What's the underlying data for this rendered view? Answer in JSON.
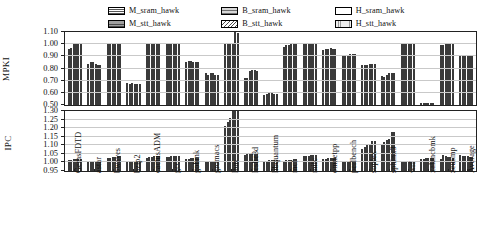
{
  "legend": {
    "position": "top-center",
    "entries": [
      {
        "label": "M_sram_hawk",
        "pattern": "p-m-sram"
      },
      {
        "label": "B_sram_hawk",
        "pattern": "p-b-sram"
      },
      {
        "label": "H_sram_hawk",
        "pattern": "p-h-sram"
      },
      {
        "label": "M_stt_hawk",
        "pattern": "p-m-stt"
      },
      {
        "label": "B_stt_hawk",
        "pattern": "p-b-stt"
      },
      {
        "label": "H_stt_hawk",
        "pattern": "p-h-stt"
      }
    ]
  },
  "chart_data": [
    {
      "type": "bar",
      "title": "",
      "ylabel": "MPKI",
      "xlabel": "",
      "ylim": [
        0.5,
        1.1
      ],
      "yticks": [
        "1.10",
        "1.00",
        "0.90",
        "0.80",
        "0.70",
        "0.60",
        "0.50"
      ],
      "ytick_values": [
        1.1,
        1.0,
        0.9,
        0.8,
        0.7,
        0.6,
        0.5
      ],
      "grid": true,
      "categories": [
        "GemsFDTD",
        "astar",
        "bwaves",
        "bzip2",
        "cactusADM",
        "gcc",
        "gobmk",
        "gromacs",
        "lbm",
        "leslie3d",
        "libquantum",
        "mcf",
        "milc",
        "omnetpp",
        "perlbench",
        "soplex",
        "sphinx3",
        "wrf",
        "xalancbmk",
        "zeusmp",
        "Average"
      ],
      "series": [
        {
          "name": "M_sram_hawk",
          "values": [
            0.96,
            0.84,
            1.0,
            0.68,
            1.0,
            1.0,
            0.85,
            0.76,
            1.0,
            0.72,
            0.58,
            0.98,
            1.0,
            0.95,
            0.9,
            0.83,
            0.74,
            1.0,
            0.52,
            0.99,
            0.9
          ]
        },
        {
          "name": "M_stt_hawk",
          "values": [
            0.97,
            0.85,
            1.0,
            0.67,
            1.0,
            1.0,
            0.86,
            0.75,
            1.0,
            0.72,
            0.59,
            0.99,
            1.0,
            0.96,
            0.91,
            0.83,
            0.73,
            1.0,
            0.52,
            0.99,
            0.9
          ]
        },
        {
          "name": "B_sram_hawk",
          "values": [
            1.0,
            0.85,
            1.0,
            0.68,
            1.0,
            1.0,
            0.86,
            0.76,
            1.0,
            0.78,
            0.6,
            0.99,
            1.0,
            0.96,
            0.91,
            0.83,
            0.75,
            1.0,
            0.52,
            1.0,
            0.9
          ]
        },
        {
          "name": "B_stt_hawk",
          "values": [
            1.0,
            0.84,
            1.0,
            0.67,
            1.0,
            1.0,
            0.85,
            0.76,
            1.0,
            0.79,
            0.6,
            1.0,
            1.0,
            0.97,
            0.92,
            0.84,
            0.76,
            1.0,
            0.52,
            1.0,
            0.91
          ]
        },
        {
          "name": "H_sram_hawk",
          "values": [
            1.0,
            0.83,
            1.0,
            0.67,
            1.0,
            1.0,
            0.85,
            0.75,
            1.1,
            0.79,
            0.59,
            1.0,
            1.0,
            0.96,
            0.92,
            0.84,
            0.76,
            1.0,
            0.52,
            1.0,
            0.91
          ]
        },
        {
          "name": "H_stt_hawk",
          "values": [
            1.0,
            0.83,
            1.0,
            0.67,
            1.0,
            1.0,
            0.85,
            0.75,
            1.09,
            0.78,
            0.59,
            1.0,
            1.0,
            0.96,
            0.92,
            0.84,
            0.76,
            1.0,
            0.52,
            1.0,
            0.91
          ]
        }
      ]
    },
    {
      "type": "bar",
      "title": "",
      "ylabel": "IPC",
      "xlabel": "",
      "ylim": [
        0.95,
        1.3
      ],
      "yticks": [
        "1.30",
        "1.25",
        "1.20",
        "1.15",
        "1.10",
        "1.05",
        "1.00",
        "0.95"
      ],
      "ytick_values": [
        1.3,
        1.25,
        1.2,
        1.15,
        1.1,
        1.05,
        1.0,
        0.95
      ],
      "grid": true,
      "categories": [
        "GemsFDTD",
        "astar",
        "bwaves",
        "bzip2",
        "cactusADM",
        "gcc",
        "gobmk",
        "gromacs",
        "lbm",
        "leslie3d",
        "libquantum",
        "mcf",
        "milc",
        "omnetpp",
        "perlbench",
        "soplex",
        "sphinx3",
        "wrf",
        "xalancbmk",
        "zeusmp",
        "Average"
      ],
      "series": [
        {
          "name": "M_sram_hawk",
          "values": [
            1.015,
            1.0,
            1.025,
            1.0,
            1.025,
            1.03,
            1.02,
            1.0,
            1.21,
            1.045,
            1.01,
            1.01,
            1.035,
            1.02,
            1.0,
            1.08,
            1.11,
            1.0,
            1.02,
            1.02,
            1.045
          ]
        },
        {
          "name": "M_stt_hawk",
          "values": [
            1.015,
            1.0,
            1.028,
            1.0,
            1.03,
            1.032,
            1.022,
            1.0,
            1.235,
            1.048,
            1.01,
            1.012,
            1.038,
            1.022,
            1.0,
            1.09,
            1.12,
            1.0,
            1.022,
            1.045,
            1.04
          ]
        },
        {
          "name": "B_sram_hawk",
          "values": [
            1.018,
            1.0,
            1.03,
            1.0,
            1.032,
            1.035,
            1.025,
            1.0,
            1.258,
            1.05,
            1.012,
            1.015,
            1.04,
            1.025,
            1.0,
            1.105,
            1.13,
            1.002,
            1.025,
            1.038,
            1.038
          ]
        },
        {
          "name": "B_stt_hawk",
          "values": [
            1.018,
            1.0,
            1.032,
            1.0,
            1.035,
            1.038,
            1.025,
            1.0,
            1.3,
            1.052,
            1.012,
            1.015,
            1.042,
            1.028,
            1.0,
            1.11,
            1.135,
            1.002,
            1.025,
            1.032,
            1.035
          ]
        },
        {
          "name": "H_sram_hawk",
          "values": [
            1.02,
            1.0,
            1.035,
            1.002,
            1.038,
            1.04,
            1.028,
            1.002,
            1.3,
            1.055,
            1.012,
            1.018,
            1.045,
            1.028,
            1.002,
            1.125,
            1.175,
            1.002,
            1.028,
            1.03,
            1.032
          ]
        },
        {
          "name": "H_stt_hawk",
          "values": [
            1.02,
            1.0,
            1.035,
            1.002,
            1.038,
            1.04,
            1.028,
            1.002,
            1.298,
            1.052,
            1.012,
            1.018,
            1.045,
            1.028,
            1.002,
            1.128,
            1.175,
            1.002,
            1.028,
            1.028,
            1.03
          ]
        }
      ]
    }
  ]
}
